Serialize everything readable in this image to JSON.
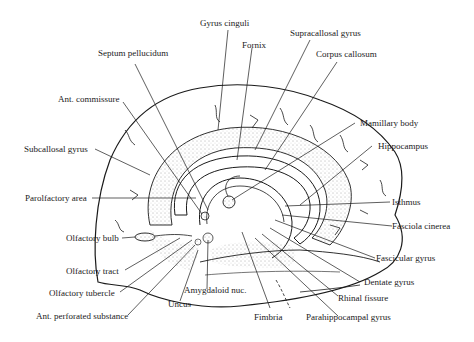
{
  "diagram": {
    "type": "anatomical-illustration",
    "colors": {
      "ink": "#1a1a1a",
      "background": "#ffffff",
      "stipple": "#555555"
    },
    "labels": [
      {
        "id": "gyrus-cinguli",
        "text": "Gyrus cinguli"
      },
      {
        "id": "septum-pellucidum",
        "text": "Septum pellucidum"
      },
      {
        "id": "fornix",
        "text": "Fornix"
      },
      {
        "id": "supracallosal-gyrus",
        "text": "Supracallosal gyrus"
      },
      {
        "id": "corpus-callosum",
        "text": "Corpus callosum"
      },
      {
        "id": "ant-commissure",
        "text": "Ant. commissure"
      },
      {
        "id": "mamillary-body",
        "text": "Mamillary body"
      },
      {
        "id": "subcallosal-gyrus",
        "text": "Subcallosal gyrus"
      },
      {
        "id": "hippocampus",
        "text": "Hippocampus"
      },
      {
        "id": "parolfactory-area",
        "text": "Parolfactory area"
      },
      {
        "id": "isthmus",
        "text": "Isthmus"
      },
      {
        "id": "fasciola-cinerea",
        "text": "Fasciola cinerea"
      },
      {
        "id": "olfactory-bulb",
        "text": "Olfactory bulb"
      },
      {
        "id": "fascicular-gyrus",
        "text": "Fascicular gyrus"
      },
      {
        "id": "olfactory-tract",
        "text": "Olfactory tract"
      },
      {
        "id": "dentate-gyrus",
        "text": "Dentate gyrus"
      },
      {
        "id": "amygdaloid-nuc",
        "text": "Amygdaloid nuc."
      },
      {
        "id": "olfactory-tubercle",
        "text": "Olfactory tubercle"
      },
      {
        "id": "rhinal-fissure",
        "text": "Rhinal fissure"
      },
      {
        "id": "uncus",
        "text": "Uncus"
      },
      {
        "id": "ant-perforated-substance",
        "text": "Ant. perforated substance"
      },
      {
        "id": "fimbria",
        "text": "Fimbria"
      },
      {
        "id": "parahippocampal-gyrus",
        "text": "Parahippocampal gyrus"
      }
    ]
  }
}
